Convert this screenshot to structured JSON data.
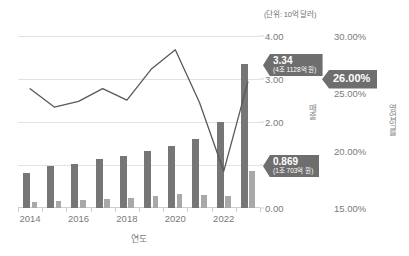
{
  "unit_note": "(단위: 10억 달러)",
  "axis_titles": {
    "x": "연도",
    "revenue": "매출",
    "margin": "영업익률"
  },
  "callouts": {
    "revenue_peak": {
      "value": "3.34",
      "sub": "(4조 1128억 원)"
    },
    "second_peak": {
      "value": "0.869",
      "sub": "(1조 703억 원)"
    },
    "margin_peak": {
      "value": "26.00%"
    }
  },
  "colors": {
    "bar_revenue": "#767676",
    "bar_second": "#a8a8a8",
    "line": "#595959",
    "callout": "#6e6e6e",
    "gridline": "#e2e2e2",
    "tick_text": "#7a7a7a"
  },
  "chart_data": {
    "type": "bar",
    "title": "",
    "xlabel": "연도",
    "ylabel": "매출",
    "y2label": "영업익률",
    "grid": true,
    "legend": "none",
    "categories": [
      2014,
      2015,
      2016,
      2017,
      2018,
      2019,
      2020,
      2021,
      2022,
      2023
    ],
    "xtick_labels": [
      "2014",
      "",
      "2016",
      "",
      "2018",
      "",
      "2020",
      "",
      "2022",
      ""
    ],
    "ylim": [
      0.0,
      4.0
    ],
    "ytick_labels": [
      "0.00",
      "1.00",
      "2.00",
      "3.00",
      "4.00"
    ],
    "ytick_values": [
      0.0,
      1.0,
      2.0,
      3.0,
      4.0
    ],
    "y2lim": [
      15.0,
      30.0
    ],
    "y2tick_labels": [
      "15.00%",
      "20.00%",
      "25.00%",
      "30.00%"
    ],
    "y2tick_values": [
      15.0,
      20.0,
      25.0,
      30.0
    ],
    "series": [
      {
        "name": "매출",
        "kind": "bar",
        "axis": "left",
        "color": "#767676",
        "values": [
          0.82,
          0.97,
          1.02,
          1.13,
          1.2,
          1.33,
          1.45,
          1.6,
          2.0,
          3.34
        ]
      },
      {
        "name": "부가 매출",
        "kind": "bar",
        "axis": "left",
        "color": "#a8a8a8",
        "values": [
          0.13,
          0.16,
          0.19,
          0.21,
          0.23,
          0.28,
          0.33,
          0.3,
          0.27,
          0.869
        ]
      },
      {
        "name": "영업익률",
        "kind": "line",
        "axis": "right",
        "color": "#595959",
        "values": [
          25.4,
          23.8,
          24.3,
          25.4,
          24.4,
          27.1,
          28.8,
          24.2,
          18.2,
          26.0
        ]
      }
    ]
  }
}
